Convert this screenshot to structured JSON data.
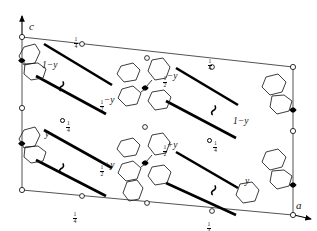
{
  "figure": {
    "type": "crystal-structure-projection",
    "axes": {
      "vertical": {
        "label": "c",
        "direction": "up"
      },
      "horizontal": {
        "label": "a",
        "direction": "right"
      }
    },
    "colors": {
      "ink": "#000000",
      "paper": "#ffffff"
    }
  },
  "edge_labels": [
    {
      "id": "top-left-quarter",
      "text": "1/4",
      "num": "1",
      "den": "4",
      "x": 74,
      "y": 31
    },
    {
      "id": "top-right-quarter",
      "text": "1/4",
      "num": "1",
      "den": "4",
      "x": 208,
      "y": 53
    },
    {
      "id": "bottom-left-quarter",
      "text": "1/4",
      "num": "1",
      "den": "4",
      "x": 74,
      "y": 206
    },
    {
      "id": "bottom-right-quarter",
      "text": "1/4",
      "num": "1",
      "den": "4",
      "x": 208,
      "y": 208
    }
  ],
  "height_labels": [
    {
      "id": "upper-left-1-minus-y",
      "text": "1−y",
      "x": 42,
      "y": 66
    },
    {
      "id": "upper-mid-half-minus-y",
      "text": "½−y",
      "x": 103,
      "y": 100,
      "stacked": true,
      "num": "1",
      "den": "2",
      "suffix": "−y"
    },
    {
      "id": "upper-right-half-minus-y",
      "text": "½−y",
      "x": 164,
      "y": 76,
      "stacked": true,
      "num": "1",
      "den": "2",
      "suffix": "−y"
    },
    {
      "id": "right-1-minus-y",
      "text": "1−y",
      "x": 232,
      "y": 122
    },
    {
      "id": "lower-left-y",
      "text": "y",
      "x": 44,
      "y": 135
    },
    {
      "id": "lower-mid-half-plus-y",
      "text": "½+y",
      "x": 103,
      "y": 165,
      "stacked": true,
      "num": "1",
      "den": "2",
      "suffix": "+y"
    },
    {
      "id": "lower-right-half-plus-y",
      "text": "½+y",
      "x": 164,
      "y": 145,
      "stacked": true,
      "num": "1",
      "den": "2",
      "suffix": "+y"
    },
    {
      "id": "lower-right-y",
      "text": "y",
      "x": 244,
      "y": 182
    }
  ],
  "circle_quarter_labels": [
    {
      "id": "left-centre-quarter",
      "text": "1/4",
      "num": "1",
      "den": "4",
      "x": 62,
      "y": 115
    },
    {
      "id": "right-centre-quarter",
      "text": "1/4",
      "num": "1",
      "den": "4",
      "x": 208,
      "y": 135
    }
  ],
  "symbols": {
    "open_circle": "inversion-centre",
    "filled_lens": "two-fold-rotation-axis",
    "arrow_bar": "glide-plane-arrow",
    "hook": "screw-axis-symbol"
  },
  "cell_corners": {
    "top_left": {
      "x": 22,
      "y": 37
    },
    "top_right": {
      "x": 293,
      "y": 67
    },
    "bottom_left": {
      "x": 22,
      "y": 190
    },
    "bottom_right": {
      "x": 293,
      "y": 215
    }
  }
}
